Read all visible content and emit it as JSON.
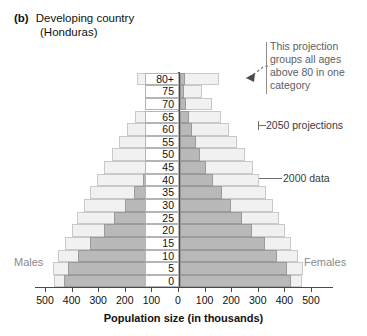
{
  "title": {
    "tag": "(b)",
    "line1": "Developing country",
    "line2": "(Honduras)"
  },
  "annotations": {
    "projection_note": "This projection groups all ages above 80 in one category",
    "series_2050_label": "2050 projections",
    "series_2000_label": "2000 data"
  },
  "sex_labels": {
    "left": "Males",
    "right": "Females"
  },
  "chart_data": {
    "type": "bar",
    "subtype": "population-pyramid",
    "title": "Developing country (Honduras)",
    "xlabel": "Population size (in thousands)",
    "ylabel": "",
    "categories": [
      "0",
      "5",
      "10",
      "15",
      "20",
      "25",
      "30",
      "35",
      "40",
      "45",
      "50",
      "55",
      "60",
      "65",
      "70",
      "75",
      "80+"
    ],
    "xticks": [
      -500,
      -400,
      -300,
      -200,
      -100,
      0,
      100,
      200,
      300,
      400,
      500
    ],
    "xticklabels": [
      "500",
      "400",
      "300",
      "200",
      "100",
      "0",
      "100",
      "200",
      "300",
      "400",
      "500"
    ],
    "xlim": [
      -560,
      560
    ],
    "grid": false,
    "legend_position": "annotations-right",
    "series": [
      {
        "name": "2050 projections",
        "color": "#f1f1f1",
        "males": [
          465,
          470,
          450,
          425,
          400,
          380,
          355,
          330,
          305,
          280,
          250,
          220,
          190,
          160,
          125,
          90,
          155
        ],
        "females": [
          460,
          465,
          445,
          420,
          395,
          375,
          350,
          325,
          300,
          275,
          245,
          215,
          185,
          155,
          120,
          85,
          150
        ]
      },
      {
        "name": "2000 data",
        "color": "#b9b9b9",
        "males": [
          430,
          415,
          375,
          330,
          280,
          240,
          200,
          165,
          130,
          100,
          80,
          62,
          48,
          36,
          26,
          17,
          20
        ],
        "females": [
          420,
          405,
          365,
          320,
          272,
          233,
          195,
          160,
          127,
          98,
          78,
          60,
          46,
          34,
          25,
          16,
          19
        ]
      }
    ]
  }
}
